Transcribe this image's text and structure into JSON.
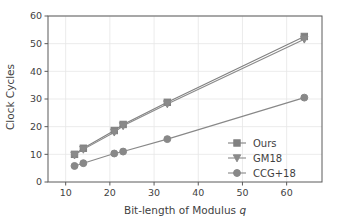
{
  "chart_data": {
    "type": "line",
    "title": "",
    "xlabel": "Bit-length of Modulus q",
    "xlabel_plain": "Bit-length of Modulus ",
    "xlabel_italic": "q",
    "ylabel": "Clock Cycles",
    "xlim": [
      6,
      68
    ],
    "ylim": [
      0,
      60
    ],
    "xticks": [
      10,
      20,
      30,
      40,
      50,
      60
    ],
    "xtick_labels": [
      "10",
      "20",
      "30",
      "40",
      "50",
      "60"
    ],
    "yticks": [
      0,
      10,
      20,
      30,
      40,
      50,
      60
    ],
    "ytick_labels": [
      "0",
      "10",
      "20",
      "30",
      "40",
      "50",
      "60"
    ],
    "grid": true,
    "grid_color": "#e6e6e6",
    "legend_position": "lower right",
    "x": [
      12,
      14,
      21,
      23,
      33,
      64
    ],
    "series": [
      {
        "name": "Ours",
        "marker": "square",
        "color": "#808080",
        "values": [
          10.0,
          12.2,
          18.6,
          20.8,
          28.8,
          52.6
        ]
      },
      {
        "name": "GM18",
        "marker": "triangle-down",
        "color": "#8a8a8a",
        "values": [
          9.7,
          11.8,
          18.0,
          20.3,
          28.2,
          51.6
        ]
      },
      {
        "name": "CCG+18",
        "marker": "circle",
        "color": "#888888",
        "values": [
          5.8,
          6.8,
          10.3,
          11.0,
          15.5,
          30.5
        ]
      }
    ]
  },
  "legend": {
    "entries": [
      {
        "label": "Ours",
        "marker": "square-marker-icon"
      },
      {
        "label": "GM18",
        "marker": "triangle-down-marker-icon"
      },
      {
        "label": "CCG+18",
        "marker": "circle-marker-icon"
      }
    ]
  }
}
